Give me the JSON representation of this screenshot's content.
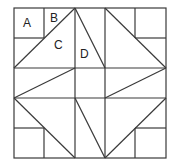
{
  "diagram": {
    "type": "quilt-block",
    "stroke_color": "#3a3a3a",
    "background": "#ffffff",
    "labels": [
      {
        "text": "A",
        "x": 23,
        "y": 27
      },
      {
        "text": "B",
        "x": 50,
        "y": 22
      },
      {
        "text": "C",
        "x": 54,
        "y": 49
      },
      {
        "text": "D",
        "x": 80,
        "y": 58
      }
    ]
  }
}
